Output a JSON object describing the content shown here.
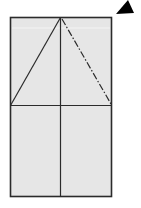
{
  "diagram": {
    "type": "origami-fold-step",
    "colors": {
      "paper": "#e6e6e6",
      "outline": "#2b2b2b",
      "arrow": "#000000",
      "background": "#ffffff"
    },
    "lines": [
      {
        "name": "vertical-center-crease",
        "style": "solid"
      },
      {
        "name": "horizontal-mid-crease",
        "style": "solid"
      },
      {
        "name": "left-diagonal-fold",
        "style": "solid"
      },
      {
        "name": "right-diagonal-mountain-fold",
        "style": "dash-dot"
      }
    ],
    "arrow": {
      "name": "turn-over-arrow",
      "shape": "filled-triangle"
    }
  }
}
